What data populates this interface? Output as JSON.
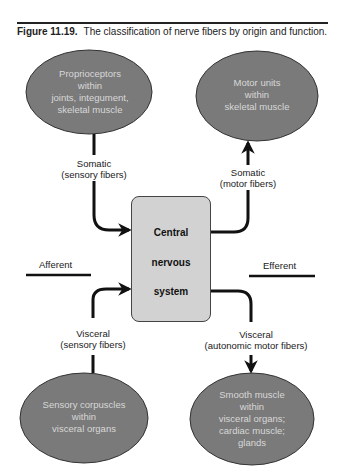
{
  "figure": {
    "number": "Figure 11.19.",
    "caption": "The classification of nerve fibers by origin and function."
  },
  "center": {
    "lines": [
      "Central",
      "nervous",
      "system"
    ],
    "fill": "#d2d2d2"
  },
  "nodes": {
    "top_left": {
      "lines": [
        "Proprioceptors",
        "within",
        "joints, integument,",
        "skeletal muscle"
      ]
    },
    "top_right": {
      "lines": [
        "Motor units",
        "within",
        "skeletal muscle"
      ]
    },
    "bottom_left": {
      "lines": [
        "Sensory corpuscles",
        "within",
        "visceral organs"
      ]
    },
    "bottom_right": {
      "lines": [
        "Smooth muscle",
        "within",
        "visceral organs;",
        "cardiac muscle;",
        "glands"
      ]
    },
    "fill": "#7a7a7a"
  },
  "edges": {
    "somatic_sensory": {
      "line1": "Somatic",
      "line2": "(sensory fibers)"
    },
    "somatic_motor": {
      "line1": "Somatic",
      "line2": "(motor fibers)"
    },
    "visceral_sensory": {
      "line1": "Visceral",
      "line2": "(sensory fibers)"
    },
    "visceral_motor": {
      "line1": "Visceral",
      "line2": "(autonomic motor fibers)"
    }
  },
  "sides": {
    "left": "Afferent",
    "right": "Efferent"
  }
}
